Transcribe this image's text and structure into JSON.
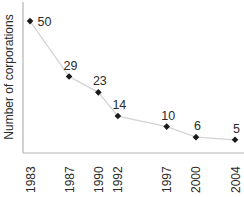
{
  "figure": {
    "bg_color": "#ffffff",
    "axis_color": "#b4b4b4",
    "line_color": "#d4d4d4",
    "marker_color": "#1a1a1a",
    "text_color": "#2b2b2b"
  },
  "chart_data": {
    "type": "line",
    "x": [
      1983,
      1987,
      1990,
      1992,
      1997,
      2000,
      2004
    ],
    "values": [
      50,
      29,
      23,
      14,
      10,
      6,
      5
    ],
    "point_labels": [
      "50",
      "29",
      "23",
      "14",
      "10",
      "6",
      "5"
    ],
    "label_positions": [
      "right",
      "top",
      "top",
      "top",
      "top",
      "top",
      "top"
    ],
    "x_tick_labels": [
      "1983",
      "1987",
      "1990",
      "1992",
      "1997",
      "2000",
      "2004"
    ],
    "title": "",
    "xlabel": "",
    "ylabel": "Number of corporations",
    "xlim": [
      1982.28,
      2004.92
    ],
    "ylim": [
      0,
      58
    ],
    "x_tick_rotation": 90,
    "grid": false,
    "legend": false,
    "marker": "diamond"
  }
}
